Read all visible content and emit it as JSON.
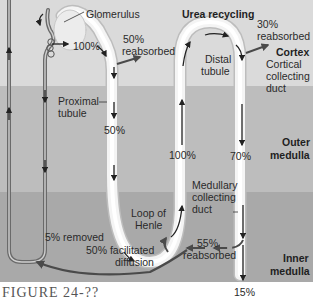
{
  "diagram": {
    "title": "Urea recycling",
    "zones": [
      {
        "name": "Cortex",
        "color": "#dadada"
      },
      {
        "name": "Outer medulla",
        "color": "#bdbdbd"
      },
      {
        "name": "Inner medulla",
        "color": "#a9a9a9"
      }
    ],
    "labels": {
      "glomerulus": "Glomerulus",
      "pct_100_glom": "100%",
      "pct_50_reab_a": "50%",
      "reabsorbed_a": "reabsorbed",
      "proximal_1": "Proximal",
      "proximal_2": "tubule",
      "pct_50": "50%",
      "title": "Urea recycling",
      "distal_1": "Distal",
      "distal_2": "tubule",
      "pct_30": "30%",
      "reabsorbed_b": "reabsorbed",
      "cortex": "Cortex",
      "cortical_1": "Cortical",
      "cortical_2": "collecting",
      "cortical_3": "duct",
      "pct_100_loop": "100%",
      "pct_70": "70%",
      "outer_1": "Outer",
      "outer_2": "medulla",
      "medullary_1": "Medullary",
      "medullary_2": "collecting",
      "medullary_3": "duct",
      "loop_1": "Loop of",
      "loop_2": "Henle",
      "removed": "5% removed",
      "facilitated_1": "50% facilitated",
      "facilitated_2": "diffusion",
      "pct_55": "55%",
      "reabsorbed_c": "reabsorbed",
      "inner_1": "Inner",
      "inner_2": "medulla",
      "pct_15": "15%"
    },
    "caption": "FIGURE 24-??"
  }
}
